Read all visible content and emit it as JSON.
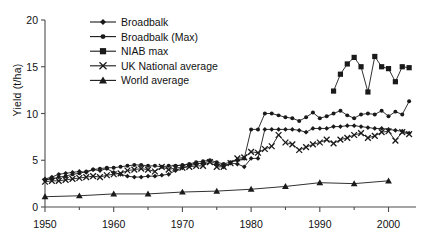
{
  "chart_data": {
    "type": "line",
    "title": "",
    "xlabel": "",
    "ylabel": "Yield (t/ha)",
    "xlim": [
      1950,
      2004
    ],
    "ylim": [
      0,
      20
    ],
    "yticks": [
      0,
      5,
      10,
      15,
      20
    ],
    "ytick_labels": [
      "0",
      "5",
      "10",
      "15",
      "20"
    ],
    "xticks": [
      1950,
      1960,
      1970,
      1980,
      1990,
      2000
    ],
    "xtick_labels": [
      "1950",
      "1960",
      "1970",
      "1980",
      "1990",
      "2000"
    ],
    "xminor_ticks": [
      1955,
      1965,
      1975,
      1985,
      1995
    ],
    "grid": false,
    "legend_position": "upper-center",
    "series": [
      {
        "name": "Broadbalk",
        "marker": "diamond",
        "color": "#1a1a1a",
        "x": [
          1950,
          1951,
          1952,
          1953,
          1954,
          1955,
          1956,
          1957,
          1958,
          1959,
          1960,
          1961,
          1962,
          1963,
          1964,
          1965,
          1966,
          1967,
          1968,
          1969,
          1970,
          1971,
          1972,
          1973,
          1974,
          1975,
          1976,
          1977,
          1978,
          1979,
          1980,
          1981,
          1982,
          1983,
          1984,
          1985,
          1986,
          1987,
          1988,
          1989,
          1990,
          1991,
          1992,
          1993,
          1994,
          1995,
          1996,
          1997,
          1998,
          1999,
          2000,
          2001,
          2002,
          2003
        ],
        "values": [
          3.0,
          3.2,
          3.5,
          3.6,
          3.7,
          3.8,
          3.7,
          4.0,
          3.9,
          4.1,
          3.7,
          3.5,
          3.3,
          3.2,
          3.2,
          3.3,
          3.3,
          3.4,
          3.5,
          3.9,
          4.2,
          4.4,
          4.6,
          4.7,
          4.9,
          4.6,
          4.3,
          4.7,
          4.6,
          4.3,
          5.2,
          5.2,
          8.3,
          8.3,
          8.3,
          8.3,
          8.3,
          8.2,
          8.0,
          8.4,
          8.4,
          8.4,
          8.6,
          8.6,
          8.7,
          8.7,
          8.6,
          8.5,
          8.4,
          8.4,
          8.3,
          8.2,
          8.1,
          7.9
        ]
      },
      {
        "name": "Broadbalk (Max)",
        "marker": "circle",
        "color": "#1a1a1a",
        "x": [
          1950,
          1951,
          1952,
          1953,
          1954,
          1955,
          1956,
          1957,
          1958,
          1959,
          1960,
          1961,
          1962,
          1963,
          1964,
          1965,
          1966,
          1967,
          1968,
          1969,
          1970,
          1971,
          1972,
          1973,
          1974,
          1975,
          1976,
          1977,
          1978,
          1979,
          1980,
          1981,
          1982,
          1983,
          1984,
          1985,
          1986,
          1987,
          1988,
          1989,
          1990,
          1991,
          1992,
          1993,
          1994,
          1995,
          1996,
          1997,
          1998,
          1999,
          2000,
          2001,
          2002,
          2003
        ],
        "values": [
          2.9,
          3.0,
          3.2,
          3.3,
          3.5,
          3.6,
          3.8,
          4.0,
          4.1,
          4.2,
          4.2,
          4.3,
          4.4,
          4.5,
          4.5,
          4.4,
          4.4,
          4.3,
          4.4,
          4.4,
          4.5,
          4.6,
          4.8,
          4.9,
          5.0,
          4.8,
          4.6,
          4.8,
          5.0,
          5.2,
          8.3,
          8.3,
          10.0,
          10.0,
          9.8,
          9.6,
          9.5,
          9.2,
          9.6,
          10.1,
          9.5,
          9.7,
          10.0,
          10.3,
          9.8,
          9.5,
          9.9,
          10.0,
          9.9,
          10.3,
          9.7,
          10.2,
          9.9,
          11.3
        ]
      },
      {
        "name": "NIAB max",
        "marker": "square",
        "color": "#1a1a1a",
        "x": [
          1992,
          1993,
          1994,
          1995,
          1996,
          1997,
          1998,
          1999,
          2000,
          2001,
          2002,
          2003
        ],
        "values": [
          12.4,
          14.2,
          15.3,
          16.0,
          15.0,
          12.3,
          16.1,
          15.0,
          14.8,
          13.4,
          15.0,
          14.9
        ]
      },
      {
        "name": "UK National average",
        "marker": "x",
        "color": "#1a1a1a",
        "x": [
          1950,
          1951,
          1952,
          1953,
          1954,
          1955,
          1956,
          1957,
          1958,
          1959,
          1960,
          1961,
          1962,
          1963,
          1964,
          1965,
          1966,
          1967,
          1968,
          1969,
          1970,
          1971,
          1972,
          1973,
          1974,
          1975,
          1976,
          1977,
          1978,
          1979,
          1980,
          1981,
          1982,
          1983,
          1984,
          1985,
          1986,
          1987,
          1988,
          1989,
          1990,
          1991,
          1992,
          1993,
          1994,
          1995,
          1996,
          1997,
          1998,
          1999,
          2000,
          2001,
          2002,
          2003
        ],
        "values": [
          2.7,
          2.8,
          2.8,
          2.9,
          3.0,
          3.1,
          3.2,
          3.3,
          3.2,
          3.4,
          3.5,
          3.6,
          3.9,
          4.0,
          4.1,
          4.0,
          3.8,
          4.3,
          4.0,
          4.2,
          4.2,
          4.3,
          4.4,
          4.4,
          4.8,
          4.3,
          4.3,
          4.7,
          5.2,
          5.3,
          5.9,
          5.8,
          6.2,
          6.5,
          7.7,
          6.9,
          6.7,
          6.1,
          6.4,
          6.7,
          6.9,
          7.2,
          6.8,
          7.2,
          7.4,
          7.7,
          7.9,
          7.4,
          7.6,
          8.0,
          8.1,
          7.1,
          8.0,
          7.8
        ]
      },
      {
        "name": "World average",
        "marker": "triangle",
        "color": "#1a1a1a",
        "x": [
          1950,
          1955,
          1960,
          1965,
          1970,
          1975,
          1980,
          1985,
          1990,
          1995,
          2000
        ],
        "values": [
          1.1,
          1.2,
          1.4,
          1.4,
          1.6,
          1.7,
          1.9,
          2.2,
          2.6,
          2.5,
          2.8
        ]
      }
    ]
  },
  "legend": {
    "items": [
      {
        "label": "Broadbalk",
        "marker": "diamond"
      },
      {
        "label": "Broadbalk (Max)",
        "marker": "circle"
      },
      {
        "label": "NIAB max",
        "marker": "square"
      },
      {
        "label": "UK National average",
        "marker": "x"
      },
      {
        "label": "World average",
        "marker": "triangle"
      }
    ]
  }
}
